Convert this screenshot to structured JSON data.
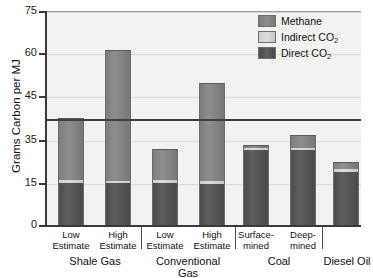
{
  "chart_data": {
    "type": "bar",
    "title": "",
    "subtitle": "",
    "xlabel": "",
    "ylabel": "Grams Carbon per MJ",
    "ylim": [
      0,
      75
    ],
    "yticks": [
      0,
      15,
      35,
      45,
      60,
      75
    ],
    "ytick_labels": [
      "0",
      "15",
      "35",
      "45",
      "60",
      "75"
    ],
    "grid": true,
    "grid_axis": "y",
    "legend_position": "top-right",
    "stacked": true,
    "reference_line": {
      "value": 40,
      "label": "",
      "color": "#3e3e3e"
    },
    "categories": [
      "Low Estimate",
      "High Estimate",
      "Low Estimate",
      "High Estimate",
      "Surface-mined",
      "Deep-mined",
      ""
    ],
    "groups": [
      {
        "label": "Shale Gas",
        "categories": [
          "Low Estimate",
          "High Estimate"
        ]
      },
      {
        "label": "Conventional Gas",
        "categories": [
          "Low Estimate",
          "High Estimate"
        ]
      },
      {
        "label": "Coal",
        "categories": [
          "Surface-mined",
          "Deep-mined"
        ]
      },
      {
        "label": "Diesel Oil",
        "categories": [
          ""
        ]
      }
    ],
    "series": [
      {
        "name": "Direct CO2",
        "color": "#545454",
        "values": [
          15.0,
          15.0,
          15.0,
          14.8,
          30.5,
          30.5,
          20.0
        ]
      },
      {
        "name": "Indirect CO2",
        "color": "#d4d4d4",
        "values": [
          1.3,
          1.0,
          1.2,
          1.2,
          0.7,
          0.6,
          1.5
        ]
      },
      {
        "name": "Methane",
        "color": "#858585",
        "values": [
          23.7,
          45.0,
          14.8,
          33.5,
          1.3,
          5.0,
          3.5
        ]
      }
    ],
    "totals": [
      40.0,
      61.0,
      31.0,
      49.5,
      32.5,
      36.1,
      25.0
    ],
    "legend": [
      {
        "label": "Methane",
        "label_main": "Methane",
        "sub": "",
        "color": "#858585"
      },
      {
        "label": "Indirect CO2",
        "label_main": "Indirect CO",
        "sub": "2",
        "color": "#d4d4d4"
      },
      {
        "label": "Direct CO2",
        "label_main": "Direct CO",
        "sub": "2",
        "color": "#545454"
      }
    ]
  },
  "axis": {
    "y_title": "Grams Carbon per MJ",
    "y_labels": [
      "75",
      "60",
      "45",
      "35",
      "15",
      "0"
    ]
  },
  "ticks": [
    {
      "line1": "Low",
      "line2": "Estimate"
    },
    {
      "line1": "High",
      "line2": "Estimate"
    },
    {
      "line1": "Low",
      "line2": "Estimate"
    },
    {
      "line1": "High",
      "line2": "Estimate"
    },
    {
      "line1": "Surface-",
      "line2": "mined"
    },
    {
      "line1": "Deep-",
      "line2": "mined"
    }
  ],
  "groups": [
    {
      "line1": "Shale Gas",
      "line2": ""
    },
    {
      "line1": "Conventional",
      "line2": "Gas"
    },
    {
      "line1": "Coal",
      "line2": ""
    },
    {
      "line1": "Diesel Oil",
      "line2": ""
    }
  ]
}
